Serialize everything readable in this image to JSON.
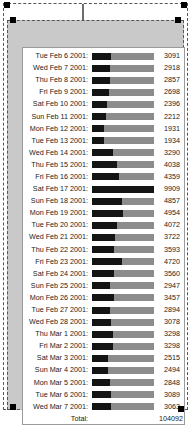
{
  "selection": {
    "handle_name": "selection-handle",
    "frame_label": "selected-chart-object"
  },
  "chart_data": {
    "type": "bar",
    "orientation": "horizontal",
    "title": "",
    "subtitle": "",
    "xlabel": "",
    "ylabel": "",
    "grid": false,
    "legend": false,
    "value_max": 9909,
    "axis_note": "bar track length scaled so the largest value (9909) fills the full track",
    "categories": [
      "Tue Feb 6 2001:",
      "Wed Feb 7 2001:",
      "Thu Feb 8 2001:",
      "Fri Feb 9 2001:",
      "Sat Feb 10 2001:",
      "Sun Feb 11 2001:",
      "Mon Feb 12 2001:",
      "Tue Feb 13 2001:",
      "Wed Feb 14 2001:",
      "Thu Feb 15 2001:",
      "Fri Feb 16 2001:",
      "Sat Feb 17 2001:",
      "Sun Feb 18 2001:",
      "Mon Feb 19 2001:",
      "Tue Feb 20 2001:",
      "Wed Feb 21 2001:",
      "Thu Feb 22 2001:",
      "Fri Feb 23 2001:",
      "Sat Feb 24 2001:",
      "Sun Feb 25 2001:",
      "Mon Feb 26 2001:",
      "Tue Feb 27 2001:",
      "Wed Feb 28 2001:",
      "Thu Mar 1 2001:",
      "Fri Mar 2 2001:",
      "Sat Mar 3 2001:",
      "Sun Mar 4 2001:",
      "Mon Mar 5 2001:",
      "Tue Mar 6 2001:",
      "Wed Mar 7 2001:"
    ],
    "values": [
      3091,
      2918,
      2857,
      2698,
      2396,
      2212,
      1931,
      1934,
      3290,
      4038,
      4359,
      9909,
      4857,
      4954,
      4072,
      3722,
      3593,
      4720,
      3560,
      2947,
      3457,
      2894,
      3078,
      3298,
      3298,
      2515,
      2494,
      2848,
      3089,
      3063
    ],
    "value_labels": [
      "3091",
      "2918",
      "2857",
      "2698",
      "2396",
      "2212",
      "1931",
      "1934",
      "3290",
      "4038",
      "4359",
      "9909",
      "4857",
      "4954",
      "4072",
      "3722",
      "3593",
      "4720",
      "3560",
      "2947",
      "3457",
      "2894",
      "3078",
      "3298",
      "3298",
      "2515",
      "2494",
      "2848",
      "3089",
      "3063"
    ]
  },
  "total": {
    "label": "Total:",
    "value": "104092"
  },
  "colors": {
    "bar_fill": "#141414",
    "bar_track": "#8c8c8c",
    "panel_background": "#ffffff",
    "object_background": "#c9c9c9",
    "text": "#1a1a1a",
    "handle": "#000000"
  }
}
